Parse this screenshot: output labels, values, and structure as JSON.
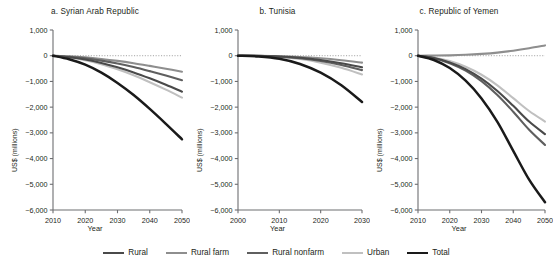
{
  "figure": {
    "axis_label_x": "Year",
    "axis_label_y": "US$ (millions)",
    "background": "#ffffff",
    "text_color": "#231f20",
    "axis_color": "#6d6e71"
  },
  "legend": {
    "position": "bottom-center",
    "items": [
      {
        "label": "Rural",
        "color": "#4a4a4a",
        "width": 2.6
      },
      {
        "label": "Rural farm",
        "color": "#8e8e8e",
        "width": 2.6
      },
      {
        "label": "Rural nonfarm",
        "color": "#5f5f5f",
        "width": 2.6
      },
      {
        "label": "Urban",
        "color": "#c0c0c0",
        "width": 2.6
      },
      {
        "label": "Total",
        "color": "#1a1a1a",
        "width": 2.9
      }
    ]
  },
  "panels": [
    {
      "id": "a",
      "title": "a.  Syrian Arab Republic"
    },
    {
      "id": "b",
      "title": "b. Tunisia"
    },
    {
      "id": "c",
      "title": "c.  Republic of Yemen"
    }
  ],
  "chart_data": {
    "type": "line",
    "title": "",
    "xlabel": "Year",
    "ylabel": "US$ (millions)",
    "ylim": [
      -6000,
      1000
    ],
    "yticks": [
      1000,
      0,
      -1000,
      -2000,
      -3000,
      -4000,
      -5000,
      -6000
    ],
    "ytick_labels": [
      "1,000",
      "0",
      "−1,000",
      "−2,000",
      "−3,000",
      "−4,000",
      "−5,000",
      "−6,000"
    ],
    "grid": false,
    "zero_reference_line": true,
    "legend_position": "bottom-center",
    "panels": [
      {
        "id": "a",
        "title": "a.  Syrian Arab Republic",
        "xlim": [
          2010,
          2050
        ],
        "xticks": [
          2010,
          2020,
          2030,
          2040,
          2050
        ],
        "xtick_labels": [
          "2010",
          "2020",
          "2030",
          "2040",
          "2050"
        ],
        "x": [
          2010,
          2015,
          2020,
          2025,
          2030,
          2035,
          2040,
          2045,
          2050
        ],
        "series": [
          {
            "name": "Rural",
            "color": "#4a4a4a",
            "values": [
              0,
              -60,
              -150,
              -280,
              -450,
              -650,
              -880,
              -1130,
              -1400
            ]
          },
          {
            "name": "Rural farm",
            "color": "#8e8e8e",
            "values": [
              0,
              -25,
              -65,
              -125,
              -200,
              -290,
              -395,
              -505,
              -620
            ]
          },
          {
            "name": "Rural nonfarm",
            "color": "#5f5f5f",
            "values": [
              0,
              -40,
              -100,
              -190,
              -300,
              -440,
              -600,
              -770,
              -950
            ]
          },
          {
            "name": "Urban",
            "color": "#c0c0c0",
            "values": [
              0,
              -70,
              -175,
              -330,
              -530,
              -760,
              -1030,
              -1320,
              -1630
            ]
          },
          {
            "name": "Total",
            "color": "#1a1a1a",
            "values": [
              0,
              -140,
              -350,
              -660,
              -1060,
              -1530,
              -2070,
              -2650,
              -3250
            ]
          }
        ]
      },
      {
        "id": "b",
        "title": "b. Tunisia",
        "xlim": [
          2000,
          2030
        ],
        "xticks": [
          2000,
          2010,
          2020,
          2030
        ],
        "xtick_labels": [
          "2000",
          "2010",
          "2020",
          "2030"
        ],
        "x": [
          2000,
          2005,
          2010,
          2015,
          2020,
          2025,
          2030
        ],
        "series": [
          {
            "name": "Rural",
            "color": "#4a4a4a",
            "values": [
              0,
              -8,
              -30,
              -80,
              -165,
              -290,
              -450
            ]
          },
          {
            "name": "Rural farm",
            "color": "#8e8e8e",
            "values": [
              0,
              -5,
              -18,
              -48,
              -100,
              -175,
              -270
            ]
          },
          {
            "name": "Rural nonfarm",
            "color": "#5f5f5f",
            "values": [
              0,
              -10,
              -38,
              -100,
              -205,
              -360,
              -560
            ]
          },
          {
            "name": "Urban",
            "color": "#c0c0c0",
            "values": [
              0,
              -12,
              -48,
              -130,
              -270,
              -470,
              -730
            ]
          },
          {
            "name": "Total",
            "color": "#1a1a1a",
            "values": [
              0,
              -30,
              -120,
              -320,
              -660,
              -1150,
              -1800
            ]
          }
        ]
      },
      {
        "id": "c",
        "title": "c.  Republic of Yemen",
        "xlim": [
          2010,
          2050
        ],
        "xticks": [
          2010,
          2020,
          2030,
          2040,
          2050
        ],
        "xtick_labels": [
          "2010",
          "2020",
          "2030",
          "2040",
          "2050"
        ],
        "x": [
          2010,
          2015,
          2020,
          2025,
          2030,
          2035,
          2040,
          2045,
          2050
        ],
        "series": [
          {
            "name": "Rural",
            "color": "#4a4a4a",
            "values": [
              0,
              -90,
              -260,
              -520,
              -890,
              -1370,
              -1950,
              -2560,
              -3050
            ]
          },
          {
            "name": "Rural farm",
            "color": "#8e8e8e",
            "values": [
              0,
              5,
              15,
              35,
              70,
              120,
              195,
              290,
              400
            ]
          },
          {
            "name": "Rural nonfarm",
            "color": "#5f5f5f",
            "values": [
              0,
              -100,
              -290,
              -580,
              -990,
              -1530,
              -2180,
              -2880,
              -3470
            ]
          },
          {
            "name": "Urban",
            "color": "#c0c0c0",
            "values": [
              0,
              -70,
              -210,
              -430,
              -740,
              -1150,
              -1650,
              -2150,
              -2560
            ]
          },
          {
            "name": "Total",
            "color": "#1a1a1a",
            "values": [
              0,
              -165,
              -480,
              -970,
              -1660,
              -2570,
              -3700,
              -4820,
              -5700
            ]
          }
        ]
      }
    ]
  }
}
